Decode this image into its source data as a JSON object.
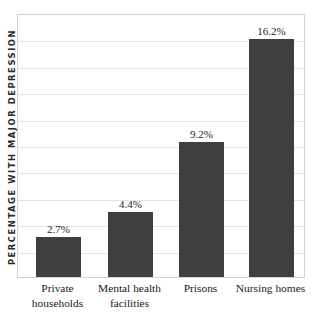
{
  "chart_data": {
    "type": "bar",
    "title": "",
    "xlabel": "",
    "ylabel": "PERCENTAGE WITH MAJOR DEPRESSION",
    "categories": [
      "Private households",
      "Mental health facilities",
      "Prisons",
      "Nursing homes"
    ],
    "category_lines": [
      [
        "Private",
        "households"
      ],
      [
        "Mental health",
        "facilities"
      ],
      [
        "Prisons",
        ""
      ],
      [
        "Nursing homes",
        ""
      ]
    ],
    "values": [
      2.7,
      4.4,
      9.2,
      16.2
    ],
    "value_labels": [
      "2.7%",
      "4.4%",
      "9.2%",
      "16.2%"
    ],
    "ylim": [
      0,
      18
    ],
    "grid": true,
    "gridline_count": 9,
    "legend": "none",
    "bar_color": "#3f3f3f",
    "gridline_color": "#e3e3e3",
    "axis_color": "#d2d2d2"
  }
}
